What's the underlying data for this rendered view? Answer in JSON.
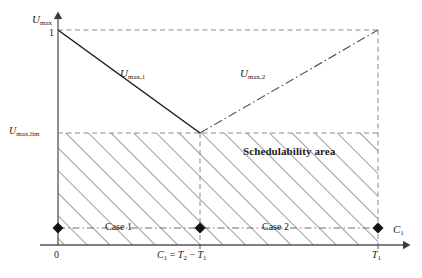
{
  "figure": {
    "type": "schedulability-region-diagram",
    "colors": {
      "axis": "#555555",
      "solid_line": "#1a1a1a",
      "dash_line": "#8a8a8a",
      "dashdot_line": "#6e6e6e",
      "hatch": "#4d4d4d",
      "marker": "#111111",
      "text": "#1a1a1a"
    }
  },
  "axes": {
    "y_axis_name": "U_max",
    "y_axis_label_base": "U",
    "y_axis_label_sub": "max",
    "x_axis_label_base": "C",
    "x_axis_label_sub": "1",
    "x_axis_name": "C_1"
  },
  "y_ticks": [
    {
      "id": "one",
      "label": "1",
      "value": 1.0,
      "y_px": 30
    },
    {
      "id": "umax_lim",
      "label_base": "U",
      "label_sub": "max,lim",
      "y_px": 133
    }
  ],
  "x_ticks": [
    {
      "id": "origin",
      "label": "0",
      "x_px": 58
    },
    {
      "id": "c1_break",
      "label": "C₁ = T₂ − T₁",
      "parts": {
        "c": "C",
        "c_sub": "1",
        "eq": " = ",
        "t2": "T",
        "t2_sub": "2",
        "minus": " − ",
        "t1": "T",
        "t1_sub": "1"
      },
      "x_px": 200
    },
    {
      "id": "t1",
      "label_base": "T",
      "label_sub": "1",
      "x_px": 378
    }
  ],
  "curves": [
    {
      "id": "umax1",
      "label_base": "U",
      "label_sub": "max,1",
      "style": "solid",
      "description": "decreasing segment from (0,1) to (C1=T2-T1, Umax_lim)",
      "points": [
        [
          58,
          30
        ],
        [
          200,
          133
        ]
      ]
    },
    {
      "id": "umax2",
      "label_base": "U",
      "label_sub": "max,2",
      "style": "dash-dot",
      "description": "increasing segment from (C1=T2-T1, Umax_lim) to (T1, 1)",
      "points": [
        [
          200,
          133
        ],
        [
          378,
          30
        ]
      ]
    }
  ],
  "region": {
    "id": "schedulability-area",
    "label": "Schedulability area",
    "fill": "diagonal-hatch",
    "bounds": {
      "x0": 58,
      "x1": 378,
      "y_top": 133,
      "y_bottom": 245
    }
  },
  "case_line": {
    "style": "dash-dot",
    "y_px": 228,
    "markers": [
      {
        "id": "marker-origin",
        "shape": "diamond",
        "x_px": 58
      },
      {
        "id": "marker-break",
        "shape": "diamond",
        "x_px": 200
      },
      {
        "id": "marker-t1",
        "shape": "diamond",
        "x_px": 378
      }
    ],
    "segments": [
      {
        "id": "case1",
        "label": "Case 1",
        "from_px": 58,
        "to_px": 200
      },
      {
        "id": "case2",
        "label": "Case 2",
        "from_px": 200,
        "to_px": 378
      }
    ]
  },
  "guides": [
    {
      "id": "top-dashed",
      "style": "dashed",
      "orientation": "horizontal",
      "from": [
        58,
        30
      ],
      "to": [
        378,
        30
      ]
    },
    {
      "id": "umaxlim-dashed",
      "style": "dashed",
      "orientation": "horizontal",
      "from": [
        58,
        133
      ],
      "to": [
        378,
        133
      ]
    },
    {
      "id": "break-dashed",
      "style": "dashed",
      "orientation": "vertical",
      "from": [
        200,
        133
      ],
      "to": [
        200,
        245
      ]
    },
    {
      "id": "t1-dashed",
      "style": "dashed",
      "orientation": "vertical",
      "from": [
        378,
        30
      ],
      "to": [
        378,
        245
      ]
    }
  ]
}
